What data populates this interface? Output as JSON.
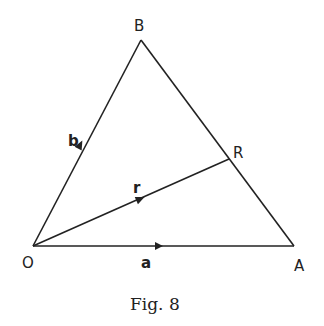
{
  "figure": {
    "caption": "Fig. 8",
    "points": {
      "O": {
        "label": "O",
        "x": 33,
        "y": 246
      },
      "A": {
        "label": "A",
        "x": 294,
        "y": 246
      },
      "B": {
        "label": "B",
        "x": 141,
        "y": 40
      },
      "R": {
        "label": "R",
        "x": 229,
        "y": 159
      }
    },
    "vectors": {
      "a": {
        "label": "a",
        "from": "O",
        "to": "A"
      },
      "b": {
        "label": "b",
        "from": "O",
        "to": "B"
      },
      "r": {
        "label": "r",
        "from": "O",
        "to": "R"
      }
    },
    "segments": [
      [
        "O",
        "A"
      ],
      [
        "O",
        "B"
      ],
      [
        "B",
        "A"
      ],
      [
        "O",
        "R"
      ]
    ],
    "colors": {
      "ink": "#222222",
      "background": "#ffffff"
    }
  }
}
